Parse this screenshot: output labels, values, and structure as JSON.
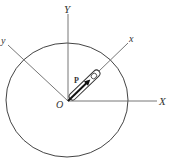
{
  "diagram": {
    "labels": {
      "Y_upper": "Y",
      "X_upper": "X",
      "x_lower": "x",
      "y_lower": "y",
      "origin": "O",
      "position_vector": "P"
    },
    "colors": {
      "line": "#555555",
      "text": "#333333",
      "vector": "#222222"
    }
  }
}
